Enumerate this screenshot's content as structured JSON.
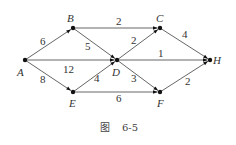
{
  "nodes": [
    {
      "id": "A",
      "x": 25,
      "y": 60,
      "lx": 17,
      "ly": 76
    },
    {
      "id": "B",
      "x": 73,
      "y": 28,
      "lx": 67,
      "ly": 22
    },
    {
      "id": "C",
      "x": 160,
      "y": 28,
      "lx": 156,
      "ly": 22
    },
    {
      "id": "D",
      "x": 117,
      "y": 60,
      "lx": 112,
      "ly": 76
    },
    {
      "id": "E",
      "x": 73,
      "y": 92,
      "lx": 69,
      "ly": 107
    },
    {
      "id": "F",
      "x": 160,
      "y": 92,
      "lx": 157,
      "ly": 107
    },
    {
      "id": "H",
      "x": 210,
      "y": 60,
      "lx": 213,
      "ly": 64
    }
  ],
  "edges": [
    {
      "from": "A",
      "to": "B",
      "weight": "6",
      "lx": 40,
      "ly": 45
    },
    {
      "from": "A",
      "to": "D",
      "weight": "12",
      "lx": 63,
      "ly": 73
    },
    {
      "from": "A",
      "to": "E",
      "weight": "8",
      "lx": 40,
      "ly": 83
    },
    {
      "from": "B",
      "to": "C",
      "weight": "2",
      "lx": 116,
      "ly": 25
    },
    {
      "from": "B",
      "to": "D",
      "weight": "5",
      "lx": 85,
      "ly": 50
    },
    {
      "from": "D",
      "to": "C",
      "weight": "2",
      "lx": 131,
      "ly": 44
    },
    {
      "from": "D",
      "to": "H",
      "weight": "1",
      "lx": 158,
      "ly": 57
    },
    {
      "from": "E",
      "to": "D",
      "weight": "4",
      "lx": 94,
      "ly": 82
    },
    {
      "from": "D",
      "to": "F",
      "weight": "3",
      "lx": 131,
      "ly": 82
    },
    {
      "from": "C",
      "to": "H",
      "weight": "4",
      "lx": 182,
      "ly": 38
    },
    {
      "from": "F",
      "to": "H",
      "weight": "2",
      "lx": 185,
      "ly": 85
    },
    {
      "from": "E",
      "to": "F",
      "weight": "6",
      "lx": 116,
      "ly": 102
    }
  ],
  "caption": {
    "figure": "图",
    "number": "6-5"
  }
}
